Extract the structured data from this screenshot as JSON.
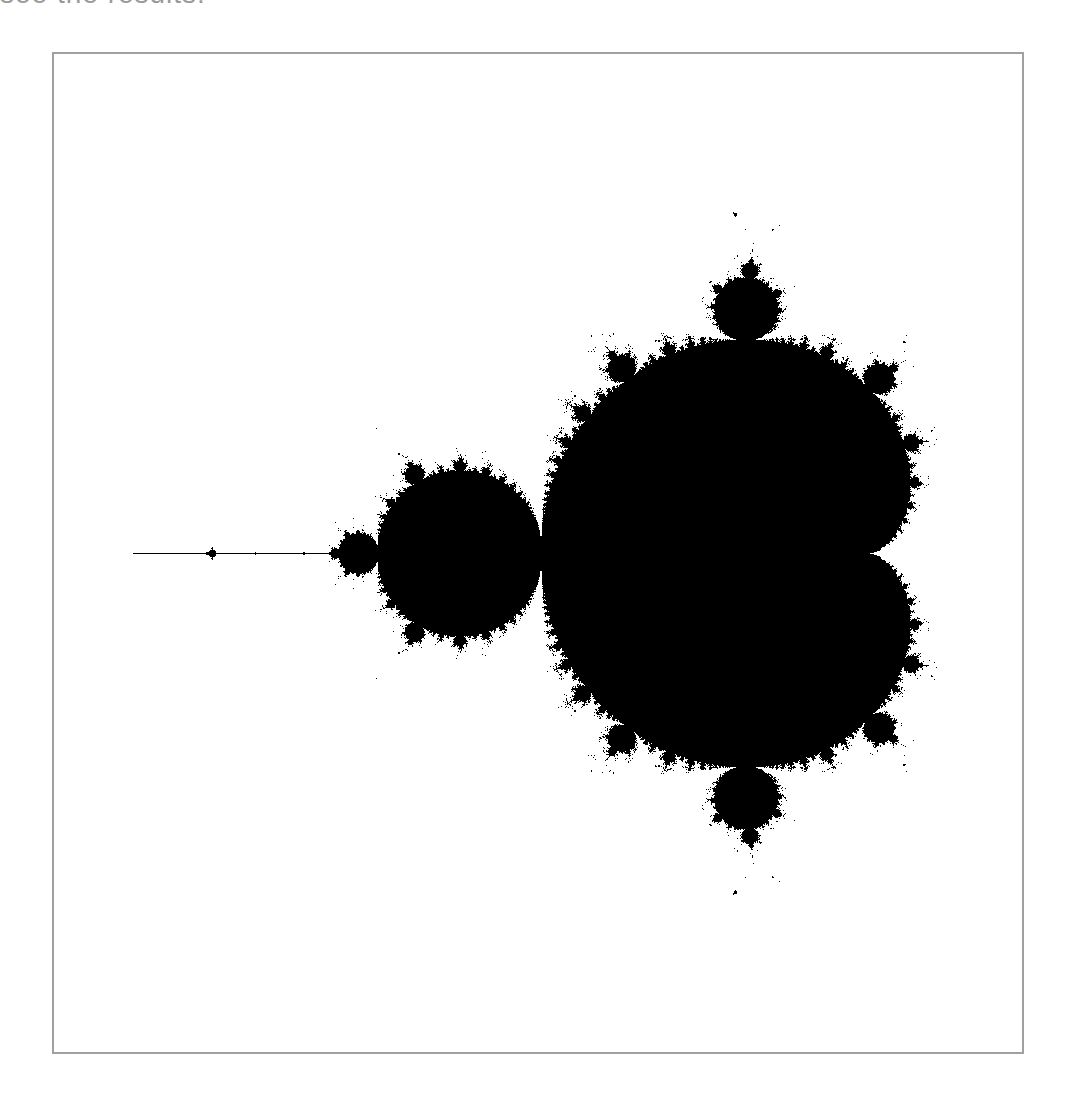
{
  "caption": "see the results:",
  "figure": {
    "view": {
      "re_min": -2.24,
      "re_max": 0.72,
      "im_min": -1.52,
      "im_max": 1.52
    },
    "max_iter": 60,
    "set_color": "#000000",
    "background_color": "#ffffff",
    "border_color": "#a0a0a0"
  }
}
